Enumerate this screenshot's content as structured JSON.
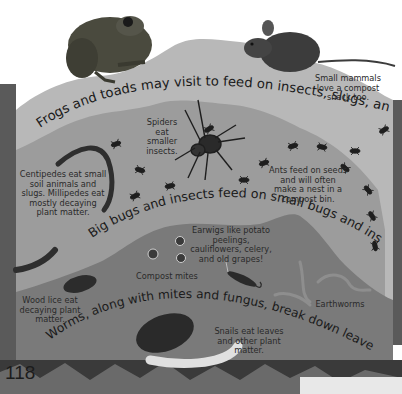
{
  "page": {
    "number": "118",
    "colors": {
      "background": "#ffffff",
      "side_bar": "#5a5a5a",
      "top_layer": "#b8b8b8",
      "middle_layer": "#9c9c9c",
      "bottom_layer": "#7a7a7a",
      "text": "#1a1a1a"
    }
  },
  "headings": {
    "top_layer": "Frogs and toads may visit to feed on insects, slugs, and snails.",
    "middle_layer": "Big bugs and insects feed on small bugs and insects.",
    "bottom_layer": "Worms, along with mites and fungus, break down leaves and paper."
  },
  "captions": {
    "small_mammals": "Small mammals love a compost snack too.",
    "spiders": "Spiders eat smaller insects.",
    "centipedes": "Centipedes eat small soil animals and slugs. Millipedes eat mostly decaying plant matter.",
    "ants": "Ants feed on seeds and will often make a nest in a compost bin.",
    "earwigs": "Earwigs like potato peelings, cauliflowers, celery, and old grapes!",
    "compost_mites": "Compost mites",
    "wood_lice": "Wood lice eat decaying plant matter.",
    "earthworms": "Earthworms",
    "snails": "Snails eat leaves and other plant matter."
  },
  "illustrations": [
    "frog-icon",
    "mouse-icon",
    "spider-icon",
    "centipede-icon",
    "millipede-icon",
    "ant-icon",
    "compost-mite-icon",
    "earwig-icon",
    "wood-louse-icon",
    "earthworm-icon",
    "snail-icon"
  ]
}
